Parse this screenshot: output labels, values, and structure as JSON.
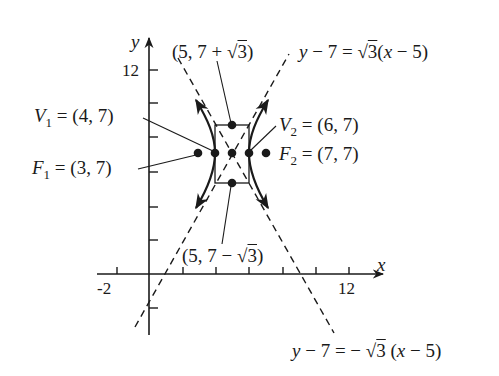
{
  "figure": {
    "axes": {
      "x_label": "x",
      "y_label": "y",
      "x_tick_labels": [
        "-2",
        "12"
      ],
      "y_tick_labels": [
        "12"
      ],
      "x_ticks": [
        -2,
        0,
        2,
        4,
        6,
        8,
        10,
        12
      ],
      "y_ticks": [
        -2,
        2,
        4,
        6,
        8,
        10,
        12
      ]
    },
    "points": {
      "center": {
        "x": 5,
        "y": 7
      },
      "v1": {
        "name": "V",
        "sub": "1",
        "value": "= (4, 7)",
        "x": 4,
        "y": 7
      },
      "v2": {
        "name": "V",
        "sub": "2",
        "value": "= (6, 7)",
        "x": 6,
        "y": 7
      },
      "f1": {
        "name": "F",
        "sub": "1",
        "value": "= (3, 7)",
        "x": 3,
        "y": 7
      },
      "f2": {
        "name": "F",
        "sub": "2",
        "value": "= (7, 7)",
        "x": 7,
        "y": 7
      },
      "top": {
        "label": "(5, 7 + √3)",
        "pre": "(5, 7 + ",
        "rad": "3",
        "post": ")"
      },
      "bottom": {
        "label": "(5, 7 − √3)",
        "pre": "(5, 7 − ",
        "rad": "3",
        "post": ")"
      }
    },
    "asymptotes": {
      "positive": {
        "label": "y − 7 = √3(x − 5)",
        "lhs": "y",
        "mid": " − 7 = ",
        "rad": "3",
        "rhs_pre": "(",
        "rhs_var": "x",
        "rhs_post": " − 5)"
      },
      "negative": {
        "label": "y − 7 = − √3 (x − 5)",
        "lhs": "y",
        "mid": " − 7 = − ",
        "rad": "3",
        "rhs_pre": " (",
        "rhs_var": "x",
        "rhs_post": " − 5)"
      }
    },
    "colors": {
      "ink": "#1a1a1a",
      "background": "#ffffff"
    }
  }
}
